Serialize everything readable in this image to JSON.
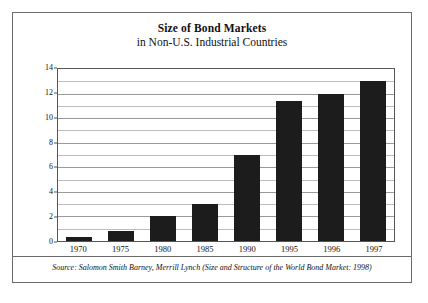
{
  "chart_data": {
    "type": "bar",
    "title": "Size of Bond Markets",
    "subtitle": "in Non-U.S. Industrial Countries",
    "xlabel": "",
    "ylabel": "$ Trillion",
    "categories": [
      "1970",
      "1975",
      "1980",
      "1985",
      "1990",
      "1995",
      "1996",
      "1997"
    ],
    "values": [
      0.3,
      0.8,
      2.0,
      3.0,
      7.0,
      11.4,
      12.0,
      13.0
    ],
    "ylim": [
      0,
      14
    ],
    "ytick_values": [
      0,
      2,
      4,
      6,
      8,
      10,
      12,
      14
    ],
    "ytick_labels": [
      "0",
      "2",
      "4",
      "6",
      "8",
      "10",
      "12",
      "14"
    ],
    "minor_gridline_values": [
      1,
      3,
      5,
      7,
      9,
      11,
      13
    ],
    "grid": true,
    "legend": false,
    "bar_color": "#1c1c1c",
    "gridline_color": "#9a9a9a",
    "axis_color": "#555555",
    "frame_color": "#6b6b6b",
    "source_note": "Source: Salomon Smith Barney, Merrill Lynch (Size and Structure of the World Bond Market: 1998)"
  }
}
